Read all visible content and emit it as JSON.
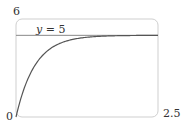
{
  "chart_data": {
    "type": "line",
    "title": "",
    "xlabel": "",
    "ylabel": "",
    "xlim": [
      0,
      2.5
    ],
    "ylim": [
      0,
      6
    ],
    "grid": false,
    "tick_labels": {
      "x_min": "0",
      "x_max": "2.5",
      "y_max": "6"
    },
    "series": [
      {
        "name": "y = 5(1 - e^(-3t))",
        "x": [
          0,
          0.1,
          0.2,
          0.3,
          0.4,
          0.5,
          0.6,
          0.8,
          1.0,
          1.25,
          1.5,
          2.0,
          2.5
        ],
        "values": [
          0,
          1.3,
          2.26,
          2.97,
          3.49,
          3.88,
          4.17,
          4.55,
          4.75,
          4.88,
          4.94,
          4.99,
          5.0
        ]
      }
    ],
    "annotations": [
      {
        "type": "hline",
        "y": 5,
        "label": "y = 5"
      }
    ],
    "colors": {
      "curve": "#555555",
      "asymptote": "#777777",
      "frame": "#cccccc"
    }
  },
  "labels": {
    "y_max": "6",
    "x_min": "0",
    "x_max": "2.5",
    "asymptote_var": "y",
    "asymptote_rest": " = 5"
  }
}
